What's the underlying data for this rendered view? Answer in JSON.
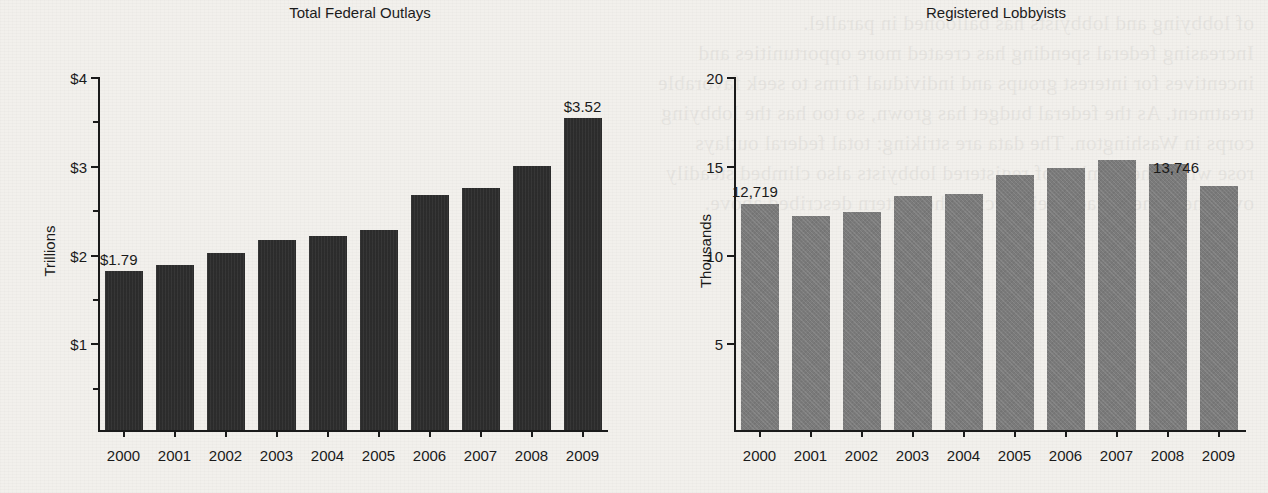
{
  "page": {
    "background_color": "#f2f0ec",
    "bleed_text": "of lobbying and lobbyists has ballooned in parallel.\nIncreasing federal spending has created more opportunities and\nincentives for interest groups and individual firms to seek favorable\ntreatment. As the federal budget has grown, so too has the lobbying\ncorps in Washington. The data are striking: total federal outlays\nrose while the number of registered lobbyists also climbed steadily\nover the same decade, reinforcing the pattern described above."
  },
  "charts": [
    {
      "id": "total-federal-outlays",
      "bar_color": "#2c2c2c",
      "chart_data": {
        "type": "bar",
        "title": "Total Federal Outlays",
        "xlabel": "",
        "ylabel": "Trillions",
        "categories": [
          "2000",
          "2001",
          "2002",
          "2003",
          "2004",
          "2005",
          "2006",
          "2007",
          "2008",
          "2009"
        ],
        "values": [
          1.79,
          1.86,
          1.99,
          2.14,
          2.19,
          2.25,
          2.65,
          2.73,
          2.98,
          3.52
        ],
        "ylim": [
          0,
          4
        ],
        "ytick_values": [
          1,
          2,
          3,
          4
        ],
        "ytick_labels": [
          "$1",
          "$2",
          "$3",
          "$4"
        ],
        "yminor_values": [
          0.5,
          1.5,
          2.5,
          3.5
        ],
        "grid": false,
        "legend": "none",
        "annotations": [
          {
            "category": "2000",
            "text": "$1.79"
          },
          {
            "category": "2009",
            "text": "$3.52"
          }
        ]
      }
    },
    {
      "id": "registered-lobbyists",
      "bar_color": "#7b7b7b",
      "chart_data": {
        "type": "bar",
        "title": "Registered Lobbyists",
        "xlabel": "",
        "ylabel": "Thousands",
        "categories": [
          "2000",
          "2001",
          "2002",
          "2003",
          "2004",
          "2005",
          "2006",
          "2007",
          "2008",
          "2009"
        ],
        "values": [
          12.719,
          12.06,
          12.28,
          13.16,
          13.32,
          14.35,
          14.75,
          15.24,
          14.97,
          13.746
        ],
        "ylim": [
          0,
          20
        ],
        "ytick_values": [
          5,
          10,
          15,
          20
        ],
        "ytick_labels": [
          "5",
          "10",
          "15",
          "20"
        ],
        "yminor_values": [],
        "grid": false,
        "legend": "none",
        "annotations": [
          {
            "category": "2000",
            "text": "12,719"
          },
          {
            "category": "2009",
            "text": "13,746"
          }
        ]
      }
    }
  ]
}
